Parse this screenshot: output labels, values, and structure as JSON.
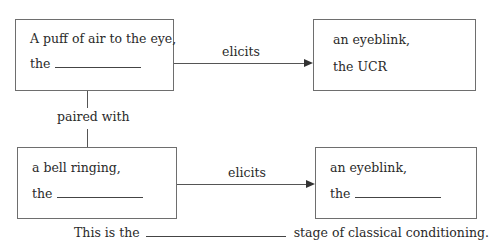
{
  "diagram": {
    "boxes": [
      {
        "id": "us",
        "line1": "A puff of air to the eye,",
        "line2_prefix": "the",
        "line2_value": "",
        "has_blank": true
      },
      {
        "id": "ucr",
        "line1": "an eyeblink,",
        "line2_prefix": "the UCR",
        "line2_value": "",
        "has_blank": false
      },
      {
        "id": "ns",
        "line1": "a bell ringing,",
        "line2_prefix": "the",
        "line2_value": "",
        "has_blank": true
      },
      {
        "id": "response",
        "line1": "an eyeblink,",
        "line2_prefix": "the",
        "line2_value": "",
        "has_blank": true
      }
    ],
    "arrows": [
      {
        "from": "us",
        "to": "ucr",
        "label": "elicits"
      },
      {
        "from": "ns",
        "to": "response",
        "label": "elicits"
      }
    ],
    "connector": {
      "from": "us",
      "to": "ns",
      "label": "paired with"
    },
    "footer": {
      "prefix": "This is the",
      "blank_value": "",
      "suffix": "stage of classical conditioning."
    }
  }
}
